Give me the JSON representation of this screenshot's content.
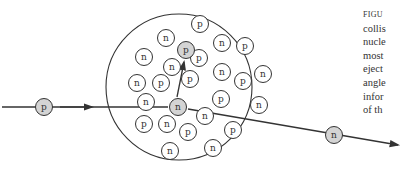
{
  "figure": {
    "caption_lines": [
      "FIGU",
      "collis",
      "nucle",
      "most",
      "eject",
      "angle",
      "infor",
      "of th"
    ],
    "colors": {
      "line": "#333333",
      "shaded_fill": "#d4d4d4",
      "background": "#ffffff"
    }
  },
  "nucleus": {
    "cx": 179,
    "cy": 87,
    "r": 73
  },
  "incoming": {
    "label": "p",
    "cx": 44,
    "cy": 107
  },
  "outgoing": {
    "label": "n",
    "cx": 334,
    "cy": 135
  },
  "struck": {
    "label": "n",
    "cx": 178,
    "cy": 107
  },
  "ejected": {
    "label": "p",
    "cx": 186,
    "cy": 50
  },
  "particles": [
    {
      "label": "p",
      "cx": 200,
      "cy": 24
    },
    {
      "label": "n",
      "cx": 166,
      "cy": 38
    },
    {
      "label": "n",
      "cx": 222,
      "cy": 43
    },
    {
      "label": "p",
      "cx": 245,
      "cy": 46
    },
    {
      "label": "n",
      "cx": 144,
      "cy": 57
    },
    {
      "label": "p",
      "cx": 199,
      "cy": 58
    },
    {
      "label": "n",
      "cx": 172,
      "cy": 67
    },
    {
      "label": "n",
      "cx": 222,
      "cy": 72
    },
    {
      "label": "n",
      "cx": 263,
      "cy": 74
    },
    {
      "label": "p",
      "cx": 190,
      "cy": 79
    },
    {
      "label": "p",
      "cx": 243,
      "cy": 81
    },
    {
      "label": "n",
      "cx": 137,
      "cy": 83
    },
    {
      "label": "p",
      "cx": 161,
      "cy": 83
    },
    {
      "label": "n",
      "cx": 146,
      "cy": 102
    },
    {
      "label": "p",
      "cx": 221,
      "cy": 99
    },
    {
      "label": "n",
      "cx": 259,
      "cy": 105
    },
    {
      "label": "n",
      "cx": 205,
      "cy": 116
    },
    {
      "label": "p",
      "cx": 144,
      "cy": 124
    },
    {
      "label": "n",
      "cx": 167,
      "cy": 124
    },
    {
      "label": "p",
      "cx": 188,
      "cy": 132
    },
    {
      "label": "p",
      "cx": 233,
      "cy": 130
    },
    {
      "label": "n",
      "cx": 170,
      "cy": 151
    },
    {
      "label": "n",
      "cx": 213,
      "cy": 148
    }
  ]
}
